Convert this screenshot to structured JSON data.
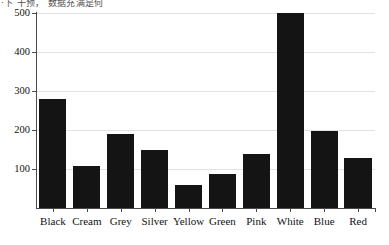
{
  "caption": {
    "text": "·下 干预， 数据充满是何"
  },
  "chart_data": {
    "type": "bar",
    "title": "",
    "subtitle": "",
    "xlabel": "",
    "ylabel": "",
    "categories": [
      "Black",
      "Cream",
      "Grey",
      "Silver",
      "Yellow",
      "Green",
      "Pink",
      "White",
      "Blue",
      "Red"
    ],
    "values": [
      280,
      108,
      190,
      150,
      60,
      88,
      138,
      500,
      198,
      128
    ],
    "series": [
      {
        "name": "Count",
        "values": [
          280,
          108,
          190,
          150,
          60,
          88,
          138,
          500,
          198,
          128
        ]
      }
    ],
    "ylim": [
      0,
      500
    ],
    "yticks": [
      100,
      200,
      300,
      400,
      500
    ],
    "ytick_labels": [
      "100",
      "200",
      "300",
      "400",
      "500"
    ],
    "grid": true,
    "grid_axis": "y",
    "legend": false,
    "legend_position": "none",
    "bar_color": "#141414",
    "grid_color": "#e2e2e2",
    "axis_color": "#4a4a4a",
    "background": "#ffffff"
  }
}
